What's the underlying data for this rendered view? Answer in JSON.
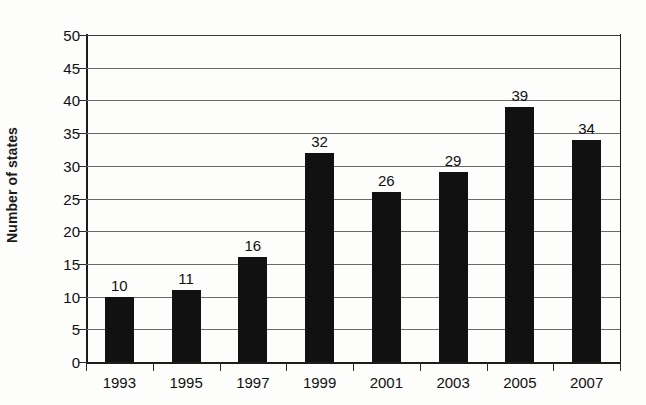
{
  "chart_data": {
    "type": "bar",
    "title": "",
    "xlabel": "",
    "ylabel": "Number of states",
    "categories": [
      "1993",
      "1995",
      "1997",
      "1999",
      "2001",
      "2003",
      "2005",
      "2007"
    ],
    "values": [
      10,
      11,
      16,
      32,
      26,
      29,
      39,
      34
    ],
    "data_labels": [
      "10",
      "11",
      "16",
      "32",
      "26",
      "29",
      "39",
      "34"
    ],
    "ylim": [
      0,
      50
    ],
    "ytick_labels": [
      "0",
      "5",
      "10",
      "15",
      "20",
      "25",
      "30",
      "35",
      "40",
      "45",
      "50"
    ],
    "ytick_values": [
      0,
      5,
      10,
      15,
      20,
      25,
      30,
      35,
      40,
      45,
      50
    ],
    "ytick_interval": 5,
    "grid": true,
    "grid_axis": "y",
    "legend": false,
    "legend_position": "none",
    "bar_color": "#111111",
    "grid_color": "#6a6a6a",
    "axis_color": "#1c1c1c",
    "background_color": "#fdfdfc",
    "show_data_labels": true
  }
}
